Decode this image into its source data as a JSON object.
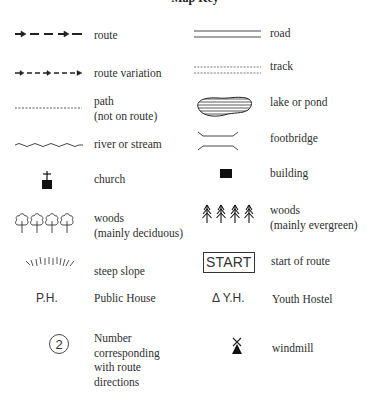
{
  "title": "Map Key",
  "colors": {
    "ink": "#2a2a2a",
    "background": "#ffffff"
  },
  "left_column": [
    {
      "id": "route",
      "icon": "route-arrow-dash-icon",
      "label": "route"
    },
    {
      "id": "route-variation",
      "icon": "route-variation-arrow-dash-icon",
      "label": "route variation"
    },
    {
      "id": "path",
      "icon": "dotted-line-icon",
      "label_lines": [
        "path",
        "(not on route)"
      ]
    },
    {
      "id": "river",
      "icon": "wavy-line-icon",
      "label": "river or stream"
    },
    {
      "id": "church",
      "icon": "church-cross-icon",
      "label": "church"
    },
    {
      "id": "woods-deciduous",
      "icon": "deciduous-trees-icon",
      "label_lines": [
        "woods",
        "(mainly deciduous)"
      ]
    },
    {
      "id": "steep-slope",
      "icon": "steep-slope-hatch-icon",
      "label": "steep slope"
    },
    {
      "id": "public-house",
      "icon_text": "P.H.",
      "label": "Public House"
    },
    {
      "id": "route-number",
      "icon_text": "2",
      "label_lines": [
        "Number",
        "corresponding",
        "with route",
        "directions"
      ]
    }
  ],
  "right_column": [
    {
      "id": "road",
      "icon": "double-line-icon",
      "label": "road"
    },
    {
      "id": "track",
      "icon": "double-dashed-line-icon",
      "label": "track"
    },
    {
      "id": "lake",
      "icon": "lake-hatched-icon",
      "label": "lake or pond"
    },
    {
      "id": "footbridge",
      "icon": "footbridge-icon",
      "label": "footbridge"
    },
    {
      "id": "building",
      "icon": "building-square-icon",
      "label": "building"
    },
    {
      "id": "woods-evergreen",
      "icon": "evergreen-trees-icon",
      "label_lines": [
        "woods",
        "(mainly evergreen)"
      ]
    },
    {
      "id": "start",
      "icon_text": "START",
      "label": "start of route"
    },
    {
      "id": "youth-hostel",
      "icon_text": "Δ Y.H.",
      "label": "Youth Hostel"
    },
    {
      "id": "windmill",
      "icon": "windmill-icon",
      "label": "windmill"
    }
  ]
}
